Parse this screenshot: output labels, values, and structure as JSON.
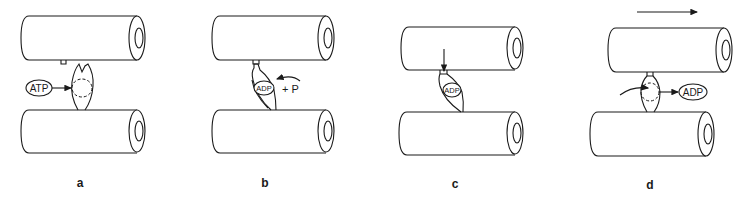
{
  "figure": {
    "colors": {
      "line": "#1a1a1a",
      "background": "#ffffff"
    },
    "panels": [
      {
        "id": "a",
        "label": "a",
        "molecules": [
          {
            "text": "ATP",
            "role": "binding"
          }
        ]
      },
      {
        "id": "b",
        "label": "b",
        "molecules": [
          {
            "text": "ADP",
            "role": "bound"
          }
        ],
        "annotation": "+ P"
      },
      {
        "id": "c",
        "label": "c",
        "molecules": [
          {
            "text": "ADP",
            "role": "bound"
          }
        ]
      },
      {
        "id": "d",
        "label": "d",
        "molecules": [
          {
            "text": "ADP",
            "role": "released"
          }
        ],
        "movement_arrow": "right"
      }
    ]
  }
}
